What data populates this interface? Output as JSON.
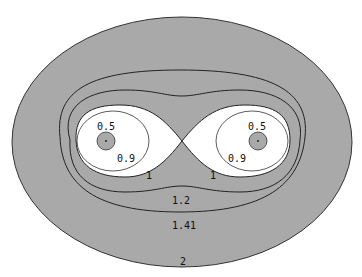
{
  "diagram": {
    "type": "contour-plot",
    "colors": {
      "region_fill": "#a9a9a9",
      "inner_fill": "#ffffff",
      "line": "#222222",
      "background": "#ffffff"
    },
    "contour_labels": {
      "left_center": "0.5",
      "right_center": "0.5",
      "left_inner": "0.9",
      "right_inner": "0.9",
      "left_lemniscate": "1",
      "right_lemniscate": "1",
      "level_1_2": "1.2",
      "level_1_41": "1.41",
      "level_2": "2"
    },
    "levels": [
      "0.5",
      "0.9",
      "1",
      "1.2",
      "1.41",
      "2"
    ]
  }
}
